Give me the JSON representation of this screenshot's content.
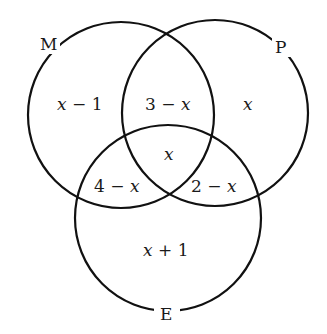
{
  "diagram": {
    "type": "venn",
    "sets": [
      {
        "name": "M",
        "label": "M"
      },
      {
        "name": "P",
        "label": "P"
      },
      {
        "name": "E",
        "label": "E"
      }
    ],
    "regions": {
      "m_only": {
        "var": "x",
        "rest": " − 1"
      },
      "m_p": {
        "num": "3 − ",
        "var": "x"
      },
      "p_only": {
        "var": "x"
      },
      "m_p_e": {
        "var": "x"
      },
      "m_e": {
        "num": "4 − ",
        "var": "x"
      },
      "p_e": {
        "num": "2 − ",
        "var": "x"
      },
      "e_only": {
        "var": "x",
        "rest": " + 1"
      }
    },
    "colors": {
      "stroke": "#111111",
      "background": "#ffffff",
      "text": "#1a1a1a"
    }
  }
}
